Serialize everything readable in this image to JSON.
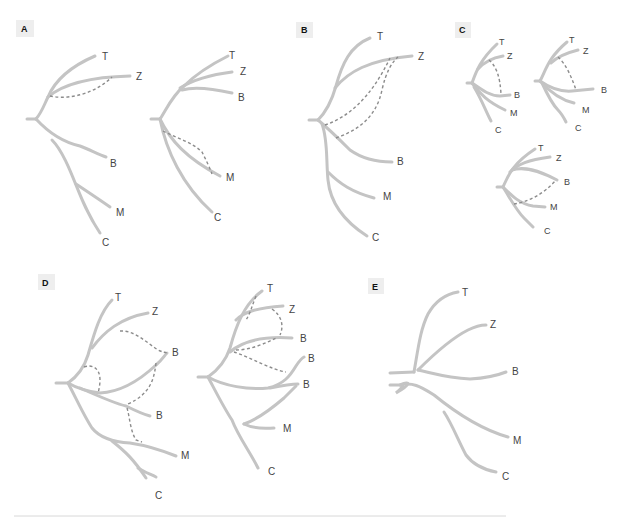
{
  "panels": {
    "A": {
      "label": "A",
      "trees": [
        {
          "leaves": {
            "T": "T",
            "Z": "Z",
            "B": "B",
            "M": "M",
            "C": "C"
          },
          "reticulations": 1
        },
        {
          "leaves": {
            "T": "T",
            "Z": "Z",
            "B": "B",
            "M": "M",
            "C": "C"
          },
          "reticulations": 1
        }
      ]
    },
    "B": {
      "label": "B",
      "trees": [
        {
          "leaves": {
            "T": "T",
            "Z": "Z",
            "B": "B",
            "M": "M",
            "C": "C"
          },
          "reticulations": 2
        }
      ]
    },
    "C": {
      "label": "C",
      "trees": [
        {
          "leaves": {
            "T": "T",
            "Z": "Z",
            "B": "B",
            "M": "M",
            "C": "C"
          },
          "reticulations": 1
        },
        {
          "leaves": {
            "T": "T",
            "Z": "Z",
            "B": "B",
            "M": "M",
            "C": "C"
          },
          "reticulations": 1
        },
        {
          "leaves": {
            "T": "T",
            "Z": "Z",
            "B": "B",
            "M": "M",
            "C": "C"
          },
          "reticulations": 1
        }
      ]
    },
    "D": {
      "label": "D",
      "trees": [
        {
          "leaves": {
            "T": "T",
            "Z": "Z",
            "B1": "B",
            "B2": "B",
            "M": "M",
            "C": "C"
          },
          "reticulations": 4
        },
        {
          "leaves": {
            "T": "T",
            "Z": "Z",
            "B1": "B",
            "B2": "B",
            "B3": "B",
            "M": "M",
            "C": "C"
          },
          "reticulations": 4
        }
      ]
    },
    "E": {
      "label": "E",
      "trees": [
        {
          "leaves": {
            "T": "T",
            "Z": "Z",
            "B": "B",
            "M": "M",
            "C": "C"
          },
          "reticulations": 0
        }
      ]
    }
  },
  "colors": {
    "branch": "#c4c4c4",
    "reticulation_dashed": "#8c8c8c",
    "label_text": "#444444",
    "panel_tag_bg": "#eeeeee"
  }
}
